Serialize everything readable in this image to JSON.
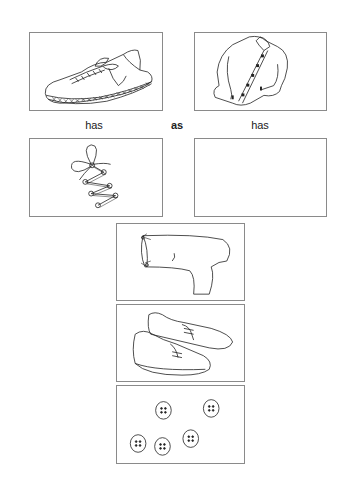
{
  "worksheet": {
    "analogy": {
      "left_word": "has",
      "middle_word": "as",
      "right_word": "has"
    },
    "cards": [
      {
        "id": "sneaker",
        "label": "sneaker-image"
      },
      {
        "id": "shirt",
        "label": "shirt-image"
      },
      {
        "id": "shoelaces",
        "label": "shoelaces-image"
      },
      {
        "id": "answer-blank",
        "label": "empty-answer-box"
      }
    ],
    "choices": [
      {
        "id": "sock",
        "label": "sock-image"
      },
      {
        "id": "loafers",
        "label": "loafers-image"
      },
      {
        "id": "buttons",
        "label": "buttons-image",
        "count": 5
      }
    ]
  }
}
